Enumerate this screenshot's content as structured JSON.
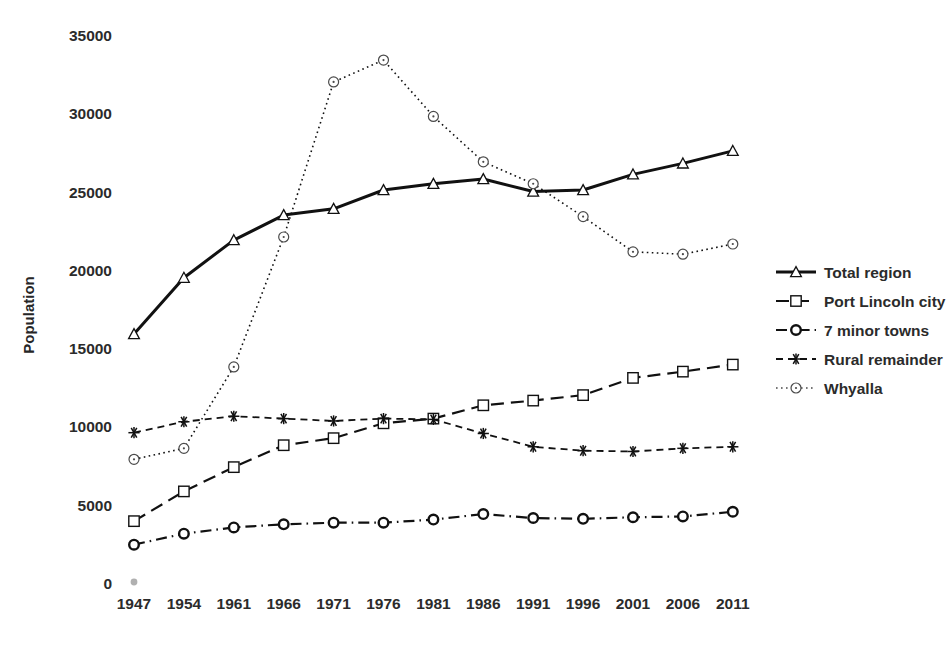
{
  "chart_data": {
    "type": "line",
    "title": "",
    "subtitle": "",
    "xlabel": "",
    "ylabel": "Population",
    "categories": [
      "1947",
      "1954",
      "1961",
      "1966",
      "1971",
      "1976",
      "1981",
      "1986",
      "1991",
      "1996",
      "2001",
      "2006",
      "2011"
    ],
    "x": [
      1947,
      1954,
      1961,
      1966,
      1971,
      1976,
      1981,
      1986,
      1991,
      1996,
      2001,
      2006,
      2011
    ],
    "ylim": [
      0,
      35000
    ],
    "yticks": [
      0,
      5000,
      10000,
      15000,
      20000,
      25000,
      30000,
      35000
    ],
    "ytick_labels": [
      "0",
      "5000",
      "10000",
      "15000",
      "20000",
      "25000",
      "30000",
      "35000"
    ],
    "grid": false,
    "legend_position": "right",
    "series": [
      {
        "name": "Total region",
        "marker": "triangle",
        "line_style": "solid",
        "line_width": 3,
        "color": "#111111",
        "values": [
          15900,
          19500,
          21900,
          23500,
          23900,
          25100,
          25500,
          25800,
          25000,
          25100,
          26100,
          26800,
          27600
        ]
      },
      {
        "name": "Port Lincoln city",
        "marker": "square",
        "line_style": "dashed",
        "line_width": 2.2,
        "color": "#111111",
        "values": [
          3950,
          5850,
          7400,
          8800,
          9250,
          10200,
          10500,
          11350,
          11650,
          12000,
          13100,
          13500,
          13950
        ]
      },
      {
        "name": "7 minor towns",
        "marker": "circle",
        "line_style": "dashdot",
        "line_width": 2.2,
        "color": "#111111",
        "values": [
          2450,
          3150,
          3550,
          3750,
          3850,
          3850,
          4050,
          4400,
          4150,
          4100,
          4200,
          4250,
          4550
        ]
      },
      {
        "name": "Rural remainder",
        "marker": "asterisk",
        "line_style": "dashed-short",
        "line_width": 1.8,
        "color": "#111111",
        "values": [
          9600,
          10300,
          10650,
          10500,
          10350,
          10500,
          10450,
          9550,
          8700,
          8450,
          8400,
          8600,
          8700
        ]
      },
      {
        "name": "Whyalla",
        "marker": "dot-circle",
        "line_style": "dotted",
        "line_width": 1.6,
        "color": "#4a4a4a",
        "values": [
          7900,
          8600,
          13800,
          22100,
          32000,
          33400,
          29800,
          26900,
          25500,
          23400,
          21150,
          21000,
          21650
        ]
      }
    ],
    "annotations": [
      {
        "name": "origin-dot",
        "x": "1947",
        "y": 0,
        "color": "#b0b0b0"
      }
    ]
  },
  "legend": {
    "items": [
      {
        "label": "Total region"
      },
      {
        "label": "Port Lincoln city"
      },
      {
        "label": "7 minor towns"
      },
      {
        "label": "Rural remainder"
      },
      {
        "label": "Whyalla"
      }
    ]
  }
}
